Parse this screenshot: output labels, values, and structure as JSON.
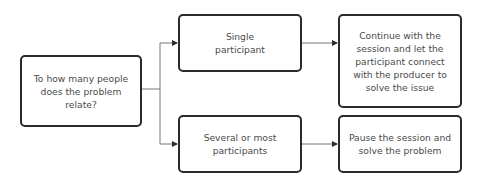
{
  "diagram": {
    "type": "flowchart",
    "colors": {
      "border": "#2b2b2b",
      "text": "#4a4a4a",
      "connector": "#555555",
      "background": "#ffffff"
    },
    "nodes": {
      "question": {
        "label": "To how many people does the problem relate?"
      },
      "single": {
        "label": "Single participant"
      },
      "several": {
        "label": "Several or most participants"
      },
      "continue": {
        "label": "Continue with the session and let the participant connect with the producer to solve the issue"
      },
      "pause": {
        "label": "Pause the session and solve the problem"
      }
    },
    "edges": [
      {
        "from": "question",
        "to": "single"
      },
      {
        "from": "question",
        "to": "several"
      },
      {
        "from": "single",
        "to": "continue"
      },
      {
        "from": "several",
        "to": "pause"
      }
    ]
  }
}
